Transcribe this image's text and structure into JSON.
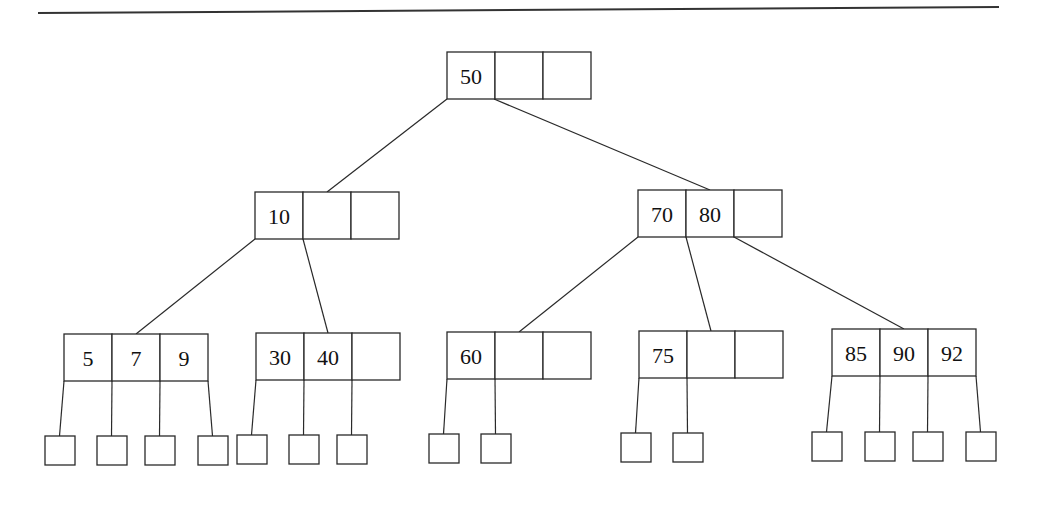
{
  "diagram": {
    "type": "B-tree",
    "colors": {
      "stroke": "#2a2a2a",
      "text": "#111111",
      "background": "#ffffff"
    },
    "top_rule": {
      "x1": 38,
      "y1": 13,
      "x2": 999,
      "y2": 7
    },
    "cell_width": 48,
    "cell_height": 47,
    "nodes": [
      {
        "id": "root",
        "level": 0,
        "x": 447,
        "y": 52,
        "keys": [
          "50",
          "",
          ""
        ]
      },
      {
        "id": "n10",
        "level": 1,
        "x": 255,
        "y": 192,
        "keys": [
          "10",
          "",
          ""
        ]
      },
      {
        "id": "n70_80",
        "level": 1,
        "x": 638,
        "y": 190,
        "keys": [
          "70",
          "80",
          ""
        ]
      },
      {
        "id": "n5_7_9",
        "level": 2,
        "x": 64,
        "y": 334,
        "keys": [
          "5",
          "7",
          "9"
        ]
      },
      {
        "id": "n30_40",
        "level": 2,
        "x": 256,
        "y": 333,
        "keys": [
          "30",
          "40",
          ""
        ]
      },
      {
        "id": "n60",
        "level": 2,
        "x": 447,
        "y": 332,
        "keys": [
          "60",
          "",
          ""
        ]
      },
      {
        "id": "n75",
        "level": 2,
        "x": 639,
        "y": 331,
        "keys": [
          "75",
          "",
          ""
        ]
      },
      {
        "id": "n85_90_92",
        "level": 2,
        "x": 832,
        "y": 329,
        "keys": [
          "85",
          "90",
          "92"
        ]
      }
    ],
    "edges": [
      {
        "from": "root",
        "to": "n10",
        "x1": 447,
        "y1": 99,
        "x2": 327,
        "y2": 192
      },
      {
        "from": "root",
        "to": "n70_80",
        "x1": 494,
        "y1": 99,
        "x2": 710,
        "y2": 190
      },
      {
        "from": "n10",
        "to": "n5_7_9",
        "x1": 255,
        "y1": 239,
        "x2": 136,
        "y2": 334
      },
      {
        "from": "n10",
        "to": "n30_40",
        "x1": 303,
        "y1": 239,
        "x2": 328,
        "y2": 333
      },
      {
        "from": "n70_80",
        "to": "n60",
        "x1": 638,
        "y1": 237,
        "x2": 519,
        "y2": 332
      },
      {
        "from": "n70_80",
        "to": "n75",
        "x1": 686,
        "y1": 237,
        "x2": 711,
        "y2": 331
      },
      {
        "from": "n70_80",
        "to": "n85_90_92",
        "x1": 734,
        "y1": 237,
        "x2": 904,
        "y2": 329
      }
    ],
    "leaf_size": 29,
    "leaves": [
      {
        "parent": "n5_7_9",
        "x": 45,
        "y": 436,
        "px": 64,
        "py": 381
      },
      {
        "parent": "n5_7_9",
        "x": 97,
        "y": 436,
        "px": 112,
        "py": 381
      },
      {
        "parent": "n5_7_9",
        "x": 145,
        "y": 436,
        "px": 160,
        "py": 381
      },
      {
        "parent": "n5_7_9",
        "x": 198,
        "y": 436,
        "px": 208,
        "py": 381
      },
      {
        "parent": "n30_40",
        "x": 237,
        "y": 435,
        "px": 256,
        "py": 380
      },
      {
        "parent": "n30_40",
        "x": 289,
        "y": 435,
        "px": 304,
        "py": 380
      },
      {
        "parent": "n30_40",
        "x": 337,
        "y": 435,
        "px": 352,
        "py": 380
      },
      {
        "parent": "n60",
        "x": 429,
        "y": 434,
        "px": 447,
        "py": 379
      },
      {
        "parent": "n60",
        "x": 481,
        "y": 434,
        "px": 495,
        "py": 379
      },
      {
        "parent": "n75",
        "x": 621,
        "y": 433,
        "px": 639,
        "py": 378
      },
      {
        "parent": "n75",
        "x": 673,
        "y": 433,
        "px": 687,
        "py": 378
      },
      {
        "parent": "n85_90_92",
        "x": 812,
        "y": 432,
        "px": 832,
        "py": 376
      },
      {
        "parent": "n85_90_92",
        "x": 865,
        "y": 432,
        "px": 880,
        "py": 376
      },
      {
        "parent": "n85_90_92",
        "x": 913,
        "y": 432,
        "px": 928,
        "py": 376
      },
      {
        "parent": "n85_90_92",
        "x": 966,
        "y": 432,
        "px": 976,
        "py": 376
      }
    ]
  }
}
